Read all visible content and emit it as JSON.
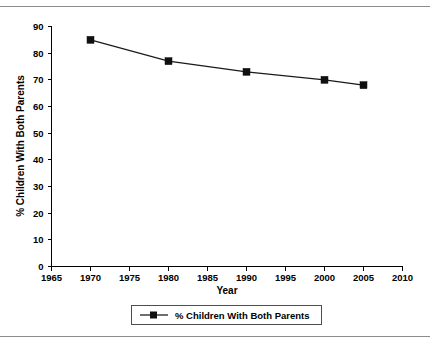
{
  "figure": {
    "top_rule": "horizontal-rule",
    "bottom_rule": "horizontal-rule"
  },
  "chart_data": {
    "type": "line",
    "title": "",
    "xlabel": "Year",
    "ylabel": "% Children With Both Parents",
    "x": [
      1970,
      1980,
      1990,
      2000,
      2005
    ],
    "values": [
      85,
      77,
      73,
      70,
      68
    ],
    "series": [
      {
        "name": "% Children With Both Parents",
        "values": [
          85,
          77,
          73,
          70,
          68
        ]
      }
    ],
    "xlim": [
      1965,
      2010
    ],
    "ylim": [
      0,
      90
    ],
    "xticks": [
      1965,
      1970,
      1975,
      1980,
      1985,
      1990,
      1995,
      2000,
      2005,
      2010
    ],
    "xtick_labels": [
      "1965",
      "1970",
      "1975",
      "1980",
      "1985",
      "1990",
      "1995",
      "2000",
      "2005",
      "2010"
    ],
    "yticks": [
      0,
      10,
      20,
      30,
      40,
      50,
      60,
      70,
      80,
      90
    ],
    "ytick_labels": [
      "0",
      "10",
      "20",
      "30",
      "40",
      "50",
      "60",
      "70",
      "80",
      "90"
    ],
    "grid": false,
    "legend": {
      "position": "bottom",
      "entries": [
        {
          "label": "% Children With Both Parents",
          "marker": "square",
          "color": "#101010",
          "line": true
        }
      ]
    },
    "colors": {
      "series": "#101010",
      "axis": "#000000",
      "rule": "#8c8c8c",
      "background": "#ffffff"
    }
  }
}
